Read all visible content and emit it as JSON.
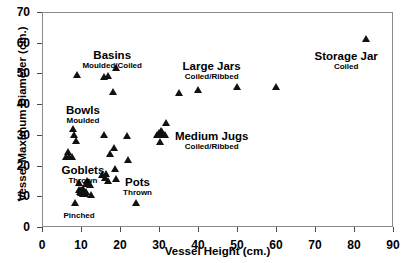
{
  "chart_data": {
    "type": "scatter",
    "title": "",
    "xlabel": "Vessel Height (cm.)",
    "ylabel": "Vessel Maximum Diameter (cm.)",
    "xlim": [
      0,
      90
    ],
    "ylim": [
      0,
      70
    ],
    "xticks": [
      0,
      10,
      20,
      30,
      40,
      50,
      60,
      70,
      80,
      90
    ],
    "yticks": [
      0,
      10,
      20,
      30,
      40,
      50,
      60,
      70
    ],
    "grid": false,
    "legend": false,
    "marker": "triangle-up",
    "marker_color": "#111111",
    "points": [
      [
        8.5,
        7.7
      ],
      [
        6.2,
        22.8
      ],
      [
        6.6,
        24.4
      ],
      [
        7.0,
        22.8
      ],
      [
        7.6,
        22.8
      ],
      [
        8.0,
        31.9
      ],
      [
        8.3,
        29.8
      ],
      [
        8.6,
        28.0
      ],
      [
        9.0,
        49.6
      ],
      [
        9.4,
        14.3
      ],
      [
        9.6,
        11.9
      ],
      [
        9.8,
        11.4
      ],
      [
        10.0,
        12.1
      ],
      [
        10.1,
        11.0
      ],
      [
        10.3,
        11.6
      ],
      [
        10.4,
        10.6
      ],
      [
        10.6,
        12.3
      ],
      [
        10.8,
        11.2
      ],
      [
        11.0,
        10.8
      ],
      [
        11.2,
        13.9
      ],
      [
        11.4,
        11.3
      ],
      [
        11.6,
        15.0
      ],
      [
        11.9,
        14.6
      ],
      [
        12.4,
        13.8
      ],
      [
        12.6,
        10.3
      ],
      [
        15.4,
        16.9
      ],
      [
        15.8,
        29.8
      ],
      [
        16.0,
        49.0
      ],
      [
        16.2,
        15.9
      ],
      [
        16.5,
        17.2
      ],
      [
        16.8,
        49.1
      ],
      [
        16.9,
        14.9
      ],
      [
        17.4,
        23.9
      ],
      [
        18.2,
        43.8
      ],
      [
        18.4,
        25.7
      ],
      [
        18.6,
        18.8
      ],
      [
        18.9,
        15.7
      ],
      [
        18.9,
        51.9
      ],
      [
        21.8,
        29.7
      ],
      [
        22.0,
        21.8
      ],
      [
        24.0,
        7.8
      ],
      [
        29.6,
        29.9
      ],
      [
        30.0,
        30.6
      ],
      [
        30.2,
        27.8
      ],
      [
        30.4,
        31.4
      ],
      [
        30.8,
        31.0
      ],
      [
        31.1,
        29.9
      ],
      [
        31.6,
        30.0
      ],
      [
        31.9,
        33.9
      ],
      [
        35.0,
        43.7
      ],
      [
        40.0,
        44.7
      ],
      [
        50.0,
        45.5
      ],
      [
        60.0,
        45.6
      ],
      [
        83.0,
        61.2
      ]
    ],
    "annotations": [
      {
        "name": "basins",
        "title": "Basins",
        "subtitle": "Moulded/Coiled",
        "x": 18.0,
        "y": 58.0
      },
      {
        "name": "bowls",
        "title": "Bowls",
        "subtitle": "Moulded",
        "x": 10.5,
        "y": 40.0
      },
      {
        "name": "goblets",
        "title": "Goblets",
        "subtitle": "Thrown",
        "x": 10.5,
        "y": 20.5
      },
      {
        "name": "pinched",
        "title": "",
        "subtitle": "Pinched",
        "x": 9.5,
        "y": 5.2
      },
      {
        "name": "pots",
        "title": "Pots",
        "subtitle": "Thrown",
        "x": 24.5,
        "y": 16.5
      },
      {
        "name": "large-jars",
        "title": "Large Jars",
        "subtitle": "Coiled/Ribbed",
        "x": 43.5,
        "y": 54.5
      },
      {
        "name": "medium-jugs",
        "title": "Medium Jugs",
        "subtitle": "Coiled/Ribbed",
        "x": 43.5,
        "y": 31.5
      },
      {
        "name": "storage-jar",
        "title": "Storage Jar",
        "subtitle": "Coiled",
        "x": 78.0,
        "y": 57.5
      }
    ]
  }
}
